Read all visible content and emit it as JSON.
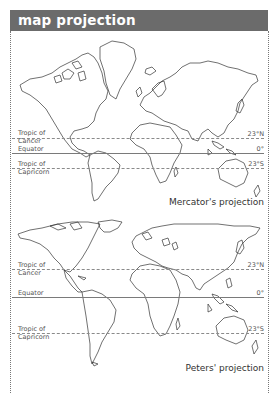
{
  "header": {
    "title": "map projection",
    "background": "#6b6b6b"
  },
  "maps": [
    {
      "name": "mercator",
      "caption": "Mercator's projection",
      "lines": [
        {
          "label": "Tropic of Cancer",
          "label_lines": [
            "Tropic of",
            "Cancer"
          ],
          "degree": "23°N",
          "style": "dashed"
        },
        {
          "label": "Equator",
          "label_lines": [
            "Equator"
          ],
          "degree": "0°",
          "style": "solid"
        },
        {
          "label": "Tropic of Capricorn",
          "label_lines": [
            "Tropic of",
            "Capricorn"
          ],
          "degree": "23°S",
          "style": "dashed"
        }
      ]
    },
    {
      "name": "peters",
      "caption": "Peters' projection",
      "lines": [
        {
          "label": "Tropic of Cancer",
          "label_lines": [
            "Tropic of",
            "Cancer"
          ],
          "degree": "23°N",
          "style": "dashed"
        },
        {
          "label": "Equator",
          "label_lines": [
            "Equator"
          ],
          "degree": "0°",
          "style": "solid"
        },
        {
          "label": "Tropic of Capricorn",
          "label_lines": [
            "Tropic of",
            "Capricorn"
          ],
          "degree": "23°S",
          "style": "dashed"
        }
      ]
    }
  ]
}
